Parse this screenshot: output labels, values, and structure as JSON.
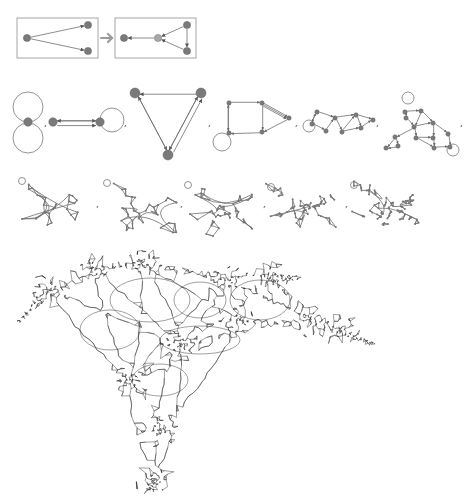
{
  "figure": {
    "separator": ",",
    "colors": {
      "node": "#7a7a7a",
      "node_new": "#a8a8a8",
      "edge": "#6e6e6e",
      "box": "#a6a6a6",
      "arrow": "#9a9a9a",
      "dense": "#2a2a2a"
    }
  },
  "rule": {
    "lhs": {
      "box": [
        17,
        18,
        81,
        40
      ],
      "nodes": [
        [
          27,
          38
        ],
        [
          88,
          25
        ],
        [
          88,
          51
        ]
      ],
      "edges": [
        [
          0,
          1
        ],
        [
          0,
          2
        ]
      ]
    },
    "arrow": {
      "from": [
        101,
        38
      ],
      "to": [
        112,
        38
      ],
      "icon": "right-arrow-icon"
    },
    "rhs": {
      "box": [
        115,
        18,
        81,
        40
      ],
      "nodes": [
        [
          124,
          38
        ],
        [
          158,
          38
        ],
        [
          187,
          25
        ],
        [
          187,
          51
        ]
      ],
      "new_nodes": [
        1
      ],
      "edges": [
        [
          1,
          0
        ],
        [
          2,
          1
        ],
        [
          3,
          1
        ],
        [
          2,
          3
        ]
      ]
    }
  },
  "evolution_row1": [
    {
      "step": 1,
      "nodes": [
        [
          28,
          122
        ]
      ],
      "edges": [],
      "loops": [
        [
          28,
          107,
          15
        ],
        [
          28,
          138,
          15
        ]
      ]
    },
    {
      "step": 2,
      "nodes": [
        [
          53,
          122
        ],
        [
          100,
          122
        ]
      ],
      "edges": [
        [
          0,
          1
        ],
        [
          1,
          0
        ],
        [
          0,
          1
        ]
      ],
      "loops": [
        [
          112,
          120,
          12
        ]
      ]
    },
    {
      "step": 3,
      "nodes": [
        [
          135,
          93
        ],
        [
          201,
          93
        ],
        [
          168,
          155
        ]
      ],
      "edges": [
        [
          1,
          0
        ],
        [
          0,
          2
        ],
        [
          2,
          0
        ],
        [
          2,
          1
        ],
        [
          1,
          2
        ],
        [
          2,
          1
        ]
      ],
      "loops": []
    },
    {
      "step": 4,
      "nodes": [
        [
          229,
          103
        ],
        [
          262,
          103
        ],
        [
          289,
          118
        ],
        [
          262,
          132
        ],
        [
          229,
          133
        ]
      ],
      "edges": [
        [
          0,
          1
        ],
        [
          1,
          2
        ],
        [
          1,
          2
        ],
        [
          1,
          2
        ],
        [
          1,
          3
        ],
        [
          2,
          3
        ],
        [
          3,
          4
        ],
        [
          4,
          0
        ],
        [
          0,
          4
        ]
      ],
      "loops": [
        [
          222,
          142,
          9
        ]
      ]
    },
    {
      "step": 5,
      "nodes": [
        [
          312,
          124
        ],
        [
          317,
          112
        ],
        [
          335,
          118
        ],
        [
          326,
          131
        ],
        [
          342,
          132
        ],
        [
          356,
          115
        ],
        [
          361,
          128
        ],
        [
          373,
          120
        ]
      ],
      "edges": [
        [
          0,
          1
        ],
        [
          1,
          2
        ],
        [
          0,
          3
        ],
        [
          3,
          2
        ],
        [
          2,
          4
        ],
        [
          2,
          5
        ],
        [
          4,
          5
        ],
        [
          5,
          6
        ],
        [
          4,
          6
        ],
        [
          6,
          7
        ],
        [
          5,
          7
        ],
        [
          1,
          0
        ]
      ],
      "loops": [
        [
          309,
          126,
          6
        ]
      ]
    },
    {
      "step": 6,
      "nodes": [
        [
          405,
          112
        ],
        [
          406,
          118
        ],
        [
          421,
          111
        ],
        [
          414,
          127
        ],
        [
          433,
          123
        ],
        [
          416,
          138
        ],
        [
          433,
          138
        ],
        [
          395,
          137
        ],
        [
          398,
          146
        ],
        [
          386,
          148
        ],
        [
          434,
          148
        ],
        [
          448,
          134
        ],
        [
          450,
          147
        ]
      ],
      "edges": [
        [
          0,
          1
        ],
        [
          0,
          2
        ],
        [
          2,
          4
        ],
        [
          1,
          3
        ],
        [
          2,
          3
        ],
        [
          3,
          4
        ],
        [
          3,
          5
        ],
        [
          4,
          6
        ],
        [
          5,
          6
        ],
        [
          3,
          7
        ],
        [
          7,
          8
        ],
        [
          7,
          9
        ],
        [
          8,
          9
        ],
        [
          5,
          10
        ],
        [
          10,
          12
        ],
        [
          4,
          11
        ],
        [
          11,
          12
        ],
        [
          6,
          10
        ]
      ],
      "loops": [
        [
          408,
          98,
          6
        ],
        [
          453,
          150,
          6
        ]
      ]
    }
  ],
  "separators_row1": [
    [
      44,
      126
    ],
    [
      124,
      126
    ],
    [
      208,
      126
    ],
    [
      295,
      126
    ],
    [
      376,
      126
    ],
    [
      460,
      126
    ]
  ],
  "evolution_row2": [
    {
      "step": 7,
      "bbox": [
        17,
        176,
        76,
        56
      ],
      "seed": 7,
      "nodes": 26
    },
    {
      "step": 8,
      "bbox": [
        102,
        178,
        78,
        56
      ],
      "seed": 8,
      "nodes": 38
    },
    {
      "step": 9,
      "bbox": [
        183,
        180,
        78,
        54
      ],
      "seed": 9,
      "nodes": 50
    },
    {
      "step": 10,
      "bbox": [
        266,
        182,
        76,
        46
      ],
      "seed": 10,
      "nodes": 64
    },
    {
      "step": 11,
      "bbox": [
        349,
        180,
        78,
        50
      ],
      "seed": 11,
      "nodes": 80
    }
  ],
  "separators_row2": [
    [
      96,
      207
    ],
    [
      180,
      207
    ],
    [
      263,
      207
    ],
    [
      345,
      207
    ]
  ],
  "final_state": {
    "step": 12,
    "bbox": [
      15,
      252,
      362,
      236
    ],
    "description": "large hypergraph after many rewriting steps",
    "hubs": [
      [
        140,
        262
      ],
      [
        92,
        268
      ],
      [
        50,
        290
      ],
      [
        228,
        280
      ],
      [
        270,
        278
      ],
      [
        310,
        320
      ],
      [
        180,
        345
      ],
      [
        130,
        380
      ],
      [
        160,
        430
      ],
      [
        155,
        480
      ],
      [
        240,
        320
      ],
      [
        340,
        330
      ]
    ]
  }
}
